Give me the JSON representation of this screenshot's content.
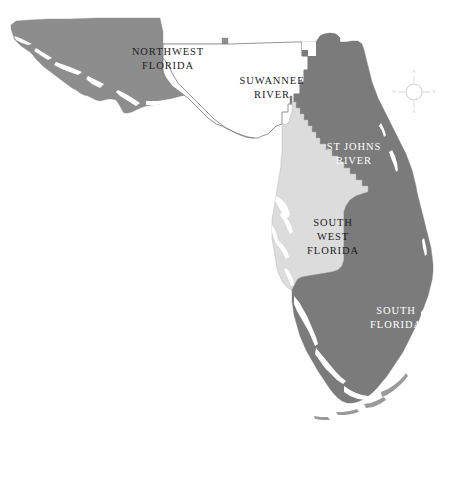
{
  "figure": {
    "caption": "",
    "background_color": "#ffffff"
  },
  "palette": {
    "dark_gray": "#7b7b7b",
    "medium_gray": "#8d8d8d",
    "light_gray": "#dcdcdc",
    "white": "#ffffff",
    "outline": "#6f6f6f",
    "label_dark": "#1d1d1d",
    "label_light": "#ffffff"
  },
  "regions": [
    {
      "id": "northwest-florida",
      "label_lines": [
        "NORTHWEST",
        "FLORIDA"
      ],
      "fill": "#8d8d8d",
      "label_color": "dark",
      "label_x": 168,
      "label_y": 59
    },
    {
      "id": "suwannee-river",
      "label_lines": [
        "SUWANNEE",
        "RIVER"
      ],
      "fill": "#ffffff",
      "label_color": "dark",
      "label_x": 272,
      "label_y": 88
    },
    {
      "id": "st-johns-river",
      "label_lines": [
        "ST JOHNS",
        "RIVER"
      ],
      "fill": "#7b7b7b",
      "label_color": "light",
      "label_x": 354,
      "label_y": 154
    },
    {
      "id": "south-west-florida",
      "label_lines": [
        "SOUTH",
        "WEST",
        "FLORIDA"
      ],
      "fill": "#dcdcdc",
      "label_color": "dark",
      "label_x": 333,
      "label_y": 237
    },
    {
      "id": "south-florida",
      "label_lines": [
        "SOUTH",
        "FLORIDA"
      ],
      "fill": "#7b7b7b",
      "label_color": "light",
      "label_x": 396,
      "label_y": 318
    }
  ],
  "compass": {
    "north": "N",
    "south": "S",
    "east": "E",
    "west": "W",
    "center_x": 414,
    "center_y": 92,
    "radius": 8
  }
}
